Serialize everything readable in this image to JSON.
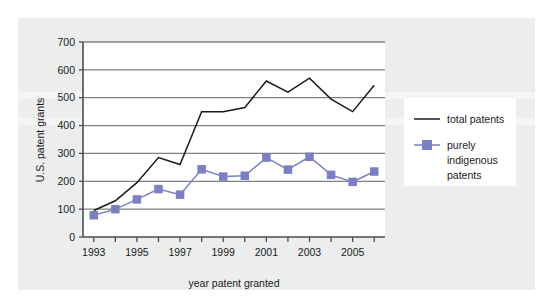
{
  "figure": {
    "background_color": "#eceded",
    "plot_background_color": "#ffffff",
    "gridline_color": "#808080",
    "axis_color": "#4d4d4d"
  },
  "chart_data": {
    "type": "line",
    "title": "",
    "xlabel": "year patent granted",
    "ylabel": "U.S. patent grants",
    "x": [
      1993,
      1994,
      1995,
      1996,
      1997,
      1998,
      1999,
      2000,
      2001,
      2002,
      2003,
      2004,
      2005,
      2006
    ],
    "xtick_labels": [
      "1993",
      "1995",
      "1997",
      "1999",
      "2001",
      "2003",
      "2005"
    ],
    "xtick_values": [
      1993,
      1995,
      1997,
      1999,
      2001,
      2003,
      2005
    ],
    "xlim": [
      1992.5,
      2006.5
    ],
    "ytick_labels": [
      "0",
      "100",
      "200",
      "300",
      "400",
      "500",
      "600",
      "700"
    ],
    "ytick_values": [
      0,
      100,
      200,
      300,
      400,
      500,
      600,
      700
    ],
    "ylim": [
      0,
      700
    ],
    "grid": "horizontal",
    "legend_position": "right",
    "series": [
      {
        "name": "total patents",
        "color": "#1a1a1a",
        "marker": "none",
        "values": [
          95,
          130,
          195,
          285,
          260,
          450,
          450,
          465,
          560,
          520,
          570,
          495,
          450,
          545
        ]
      },
      {
        "name": "purely indigenous patents",
        "color": "#7b7fc4",
        "marker": "square",
        "values": [
          78,
          100,
          135,
          172,
          152,
          243,
          217,
          220,
          285,
          242,
          288,
          223,
          198,
          235
        ]
      }
    ]
  },
  "legend": {
    "entries": [
      {
        "label": "total patents",
        "color": "#1a1a1a",
        "marker": "none"
      },
      {
        "label_line_1": "purely",
        "label_line_2": "indigenous",
        "label_line_3": "patents",
        "color": "#7b7fc4",
        "marker": "square"
      }
    ]
  }
}
